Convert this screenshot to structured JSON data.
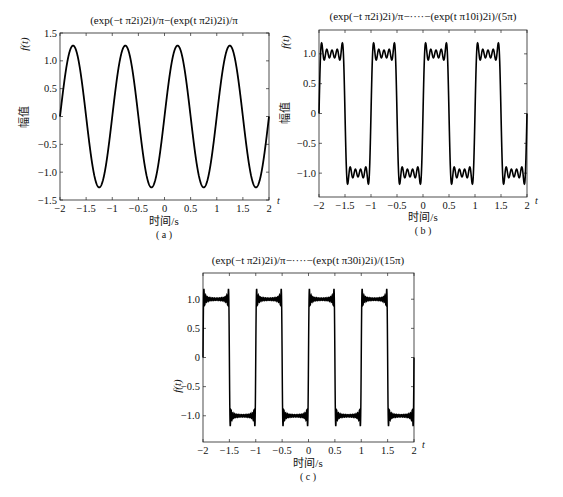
{
  "chart_data": [
    {
      "type": "line",
      "panel": "a",
      "title": "(exp(−t π2i)2i)/π−(exp(t π2i)2i)/π",
      "xlabel": "时间/s",
      "ylabel": "幅值",
      "ylabel_top": "f(t)",
      "x_axis_end_label": "t",
      "caption": "( a )",
      "xlim": [
        -2,
        2
      ],
      "ylim": [
        -1.5,
        1.5
      ],
      "xticks": [
        "-2",
        "-1.5",
        "-1",
        "-0.5",
        "0",
        "0.5",
        "1",
        "1.5",
        "2"
      ],
      "yticks": [
        "-1.5",
        "-1.0",
        "-0.5",
        "0",
        "0.5",
        "1.0",
        "1.5"
      ],
      "series": [
        {
          "name": "f(t)",
          "formula": "(4/pi)*sin(2*pi*t)",
          "harmonics": [
            1
          ],
          "peak": 1.27
        }
      ],
      "grid": false
    },
    {
      "type": "line",
      "panel": "b",
      "title": "(exp(−t π2i)2i)/π−····−(exp(t π10i)2i)/(5π)",
      "xlabel": "时间/s",
      "ylabel": "幅值",
      "ylabel_top": "f(t)",
      "x_axis_end_label": "t",
      "caption": "( b )",
      "xlim": [
        -2,
        2
      ],
      "ylim": [
        -1.4,
        1.4
      ],
      "xticks": [
        "-2",
        "-1.5",
        "-1",
        "-0.5",
        "0",
        "0.5",
        "1",
        "1.5",
        "2"
      ],
      "yticks": [
        "-1.0",
        "-0.5",
        "0",
        "0.5",
        "1.0"
      ],
      "series": [
        {
          "name": "f(t)",
          "formula": "sum_{k odd, 1..9} (4/(k*pi))*sin(2*pi*k*t)",
          "harmonics": [
            1,
            3,
            5,
            7,
            9
          ],
          "peak": 1.2
        }
      ],
      "grid": false
    },
    {
      "type": "line",
      "panel": "c",
      "title": "(exp(−t π2i)2i)/π−····−(exp(t π30i)2i)/(15π)",
      "xlabel": "时间/s",
      "ylabel": "f(t)",
      "x_axis_end_label": "t",
      "caption": "( c )",
      "xlim": [
        -2,
        2
      ],
      "ylim": [
        -1.45,
        1.45
      ],
      "xticks": [
        "-2",
        "-1.5",
        "-1",
        "-0.5",
        "0",
        "0.5",
        "1",
        "1.5",
        "2"
      ],
      "yticks": [
        "-1.0",
        "-0.5",
        "0",
        "0.5",
        "1.0"
      ],
      "series": [
        {
          "name": "f(t)",
          "formula": "sum_{k odd, 1..29} (4/(k*pi))*sin(2*pi*k*t)",
          "harmonics": [
            1,
            3,
            5,
            7,
            9,
            11,
            13,
            15,
            17,
            19,
            21,
            23,
            25,
            27,
            29
          ],
          "peak": 1.18
        }
      ],
      "grid": false
    }
  ],
  "panels": {
    "a": {
      "title": "(exp(−t π2i)2i)/π−(exp(t π2i)2i)/π",
      "xlabel": "时间/s",
      "ylabel": "幅值",
      "ytop": "f(t)",
      "tlabel": "t",
      "caption": "( a )"
    },
    "b": {
      "title": "(exp(−t π2i)2i)/π−····−(exp(t π10i)2i)/(5π)",
      "xlabel": "时间/s",
      "ylabel": "幅值",
      "ytop": "f(t)",
      "tlabel": "t",
      "caption": "( b )"
    },
    "c": {
      "title": "(exp(−t π2i)2i)/π−····−(exp(t π30i)2i)/(15π)",
      "xlabel": "时间/s",
      "ylabel": "f(t)",
      "tlabel": "t",
      "caption": "( c )"
    }
  }
}
